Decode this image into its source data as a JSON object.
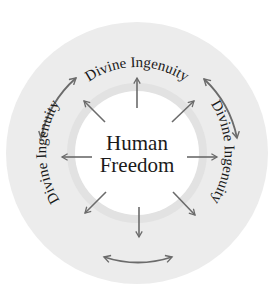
{
  "diagram": {
    "center_label_line1": "Human",
    "center_label_line2": "Freedom",
    "ring_labels": {
      "top": "Divine Ingenuity",
      "right": "Divine Ingenuity",
      "left": "Divine Ingenuity"
    },
    "colors": {
      "outer_ring": "#ececec",
      "inner_halo": "#e2e2e2",
      "center_disc": "#ffffff",
      "arrow": "#6b6b6b",
      "text": "#1a1a1a"
    }
  }
}
